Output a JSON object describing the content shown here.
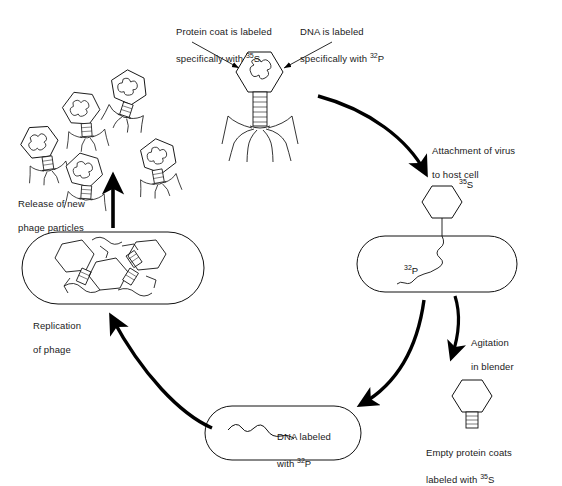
{
  "diagram": {
    "ink_color": "#000000",
    "background_color": "#ffffff"
  },
  "labels": {
    "protein_coat": {
      "line1": "Protein coat is labeled",
      "line2_pre": "specifically with ",
      "isotope": "35",
      "element": "S"
    },
    "dna_labeled": {
      "line1": "DNA is labeled",
      "line2_pre": "specifically with ",
      "isotope": "32",
      "element": "P"
    },
    "attachment": {
      "line1": "Attachment of virus",
      "line2": "to host cell"
    },
    "agitation": {
      "line1": "Agitation",
      "line2": "in blender"
    },
    "empty_coats": {
      "line1": "Empty protein coats",
      "line2_pre": "labeled with ",
      "isotope": "35",
      "element": "S"
    },
    "dna_in_cell": {
      "line1": "DNA labeled",
      "line2_pre": "with ",
      "isotope": "32",
      "element": "P"
    },
    "replication": {
      "line1": "Replication",
      "line2": "of phage"
    },
    "release": {
      "line1": "Release of new",
      "line2": "phage particles"
    }
  },
  "markers": {
    "head_s35": {
      "isotope": "35",
      "element": "S"
    },
    "dna_p32": {
      "isotope": "32",
      "element": "P"
    }
  },
  "stages": [
    {
      "id": "free-phage",
      "name": "Labeled bacteriophage T2"
    },
    {
      "id": "attached-phage",
      "name": "Phage attached to host cell"
    },
    {
      "id": "empty-coat",
      "name": "Empty protein coat after blending"
    },
    {
      "id": "infected-cell",
      "name": "Host cell containing phage DNA"
    },
    {
      "id": "replication-cell",
      "name": "Host cell with replicating phage"
    },
    {
      "id": "released-phages",
      "name": "Newly released phage particles"
    }
  ]
}
